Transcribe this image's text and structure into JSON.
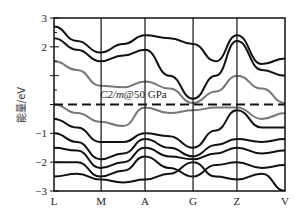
{
  "chart_data": {
    "type": "line",
    "title": "",
    "annotation": "C2/m@50 GPa",
    "xlabel": "",
    "ylabel": "能量/eV",
    "ylim": [
      -3,
      3
    ],
    "yticks": [
      3,
      2,
      1,
      0,
      -1,
      -2,
      -3
    ],
    "ytick_labels": [
      "3",
      "2",
      "",
      "",
      "-1",
      "-2",
      "-3"
    ],
    "high_symmetry_points": [
      "L",
      "M",
      "A",
      "G",
      "Z",
      "V"
    ],
    "high_symmetry_positions": [
      0,
      0.204,
      0.394,
      0.602,
      0.792,
      1.0
    ],
    "fermi_level": 0,
    "fermi_line_style": "dashed",
    "grid": false,
    "series": [
      {
        "name": "conduction band (gray, lowest)",
        "color": "#777777",
        "x": [
          0,
          0.1,
          0.2,
          0.3,
          0.394,
          0.5,
          0.602,
          0.7,
          0.792,
          0.9,
          1.0
        ],
        "values": [
          1.5,
          1.2,
          0.65,
          0.6,
          0.8,
          0.55,
          0.05,
          0.45,
          1.0,
          0.55,
          0.05
        ]
      },
      {
        "name": "conduction band 2",
        "color": "#111111",
        "x": [
          0,
          0.1,
          0.2,
          0.3,
          0.394,
          0.5,
          0.602,
          0.7,
          0.792,
          0.9,
          1.0
        ],
        "values": [
          2.3,
          1.9,
          1.5,
          1.7,
          1.9,
          1.0,
          0.2,
          1.0,
          2.2,
          1.2,
          1.0
        ]
      },
      {
        "name": "conduction band 3",
        "color": "#111111",
        "x": [
          0,
          0.1,
          0.2,
          0.3,
          0.394,
          0.5,
          0.602,
          0.7,
          0.792,
          0.9,
          1.0
        ],
        "values": [
          2.7,
          2.2,
          1.8,
          2.1,
          2.4,
          2.3,
          2.1,
          1.5,
          2.4,
          1.4,
          1.6
        ]
      },
      {
        "name": "valence band (gray, highest)",
        "color": "#777777",
        "x": [
          0,
          0.1,
          0.2,
          0.3,
          0.394,
          0.5,
          0.602,
          0.7,
          0.792,
          0.9,
          1.0
        ],
        "values": [
          0.0,
          -0.3,
          -0.6,
          -0.75,
          -0.1,
          -0.3,
          -0.2,
          -0.1,
          -0.1,
          -0.5,
          -0.3
        ]
      },
      {
        "name": "valence band 2",
        "color": "#111111",
        "x": [
          0,
          0.1,
          0.2,
          0.3,
          0.394,
          0.5,
          0.602,
          0.7,
          0.792,
          0.9,
          1.0
        ],
        "values": [
          -0.5,
          -0.8,
          -1.3,
          -1.3,
          -1.0,
          -1.1,
          -1.5,
          -0.9,
          -0.2,
          -0.8,
          -0.8
        ]
      },
      {
        "name": "valence band 3",
        "color": "#111111",
        "x": [
          0,
          0.1,
          0.2,
          0.3,
          0.394,
          0.5,
          0.602,
          0.7,
          0.792,
          0.9,
          1.0
        ],
        "values": [
          -1.0,
          -1.3,
          -1.9,
          -1.7,
          -1.2,
          -1.5,
          -1.8,
          -1.4,
          -1.2,
          -1.3,
          -1.2
        ]
      },
      {
        "name": "valence band 4",
        "color": "#111111",
        "x": [
          0,
          0.1,
          0.2,
          0.3,
          0.394,
          0.5,
          0.602,
          0.7,
          0.792,
          0.9,
          1.0
        ],
        "values": [
          -1.5,
          -1.6,
          -2.2,
          -2.0,
          -1.5,
          -1.8,
          -1.9,
          -1.7,
          -1.5,
          -1.7,
          -1.6
        ]
      },
      {
        "name": "valence band 5",
        "color": "#111111",
        "x": [
          0,
          0.1,
          0.2,
          0.3,
          0.394,
          0.5,
          0.602,
          0.7,
          0.792,
          0.9,
          1.0
        ],
        "values": [
          -2.0,
          -2.0,
          -2.5,
          -2.3,
          -1.8,
          -2.2,
          -2.5,
          -2.1,
          -2.0,
          -2.2,
          -2.1
        ]
      },
      {
        "name": "valence band 6",
        "color": "#111111",
        "x": [
          0,
          0.1,
          0.2,
          0.3,
          0.394,
          0.5,
          0.602,
          0.7,
          0.792,
          0.9,
          1.0
        ],
        "values": [
          -2.5,
          -2.4,
          -2.6,
          -2.7,
          -2.6,
          -2.4,
          -2.0,
          -2.5,
          -2.6,
          -2.4,
          -3.0
        ]
      }
    ]
  }
}
